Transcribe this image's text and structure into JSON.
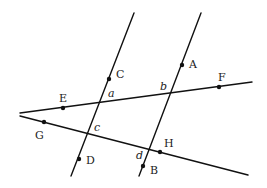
{
  "diagram": {
    "width": 267,
    "height": 188,
    "colors": {
      "line": "#111111",
      "text": "#222222",
      "background": "#ffffff"
    },
    "lines": [
      {
        "id": "line-CD",
        "x1": 134,
        "y1": 13,
        "x2": 71,
        "y2": 176
      },
      {
        "id": "line-AB",
        "x1": 201,
        "y1": 13,
        "x2": 139,
        "y2": 176
      },
      {
        "id": "line-EF",
        "x1": 20,
        "y1": 113,
        "x2": 252,
        "y2": 82
      },
      {
        "id": "line-GH",
        "x1": 20,
        "y1": 116,
        "x2": 248,
        "y2": 175
      }
    ],
    "points": [
      {
        "name": "A",
        "x": 182,
        "y": 65,
        "lx": 189,
        "ly": 68
      },
      {
        "name": "B",
        "x": 143,
        "y": 166,
        "lx": 150,
        "ly": 174
      },
      {
        "name": "C",
        "x": 109,
        "y": 79,
        "lx": 116,
        "ly": 78
      },
      {
        "name": "D",
        "x": 79,
        "y": 159,
        "lx": 86,
        "ly": 164
      },
      {
        "name": "E",
        "x": 63,
        "y": 108,
        "lx": 59,
        "ly": 102
      },
      {
        "name": "F",
        "x": 219,
        "y": 87,
        "lx": 218,
        "ly": 81
      },
      {
        "name": "G",
        "x": 44,
        "y": 122,
        "lx": 35,
        "ly": 139
      },
      {
        "name": "H",
        "x": 160,
        "y": 152,
        "lx": 164,
        "ly": 147
      }
    ],
    "angle_labels": [
      {
        "name": "a",
        "x": 108,
        "y": 97
      },
      {
        "name": "b",
        "x": 160,
        "y": 90
      },
      {
        "name": "c",
        "x": 94,
        "y": 131
      },
      {
        "name": "d",
        "x": 136,
        "y": 159
      }
    ]
  }
}
